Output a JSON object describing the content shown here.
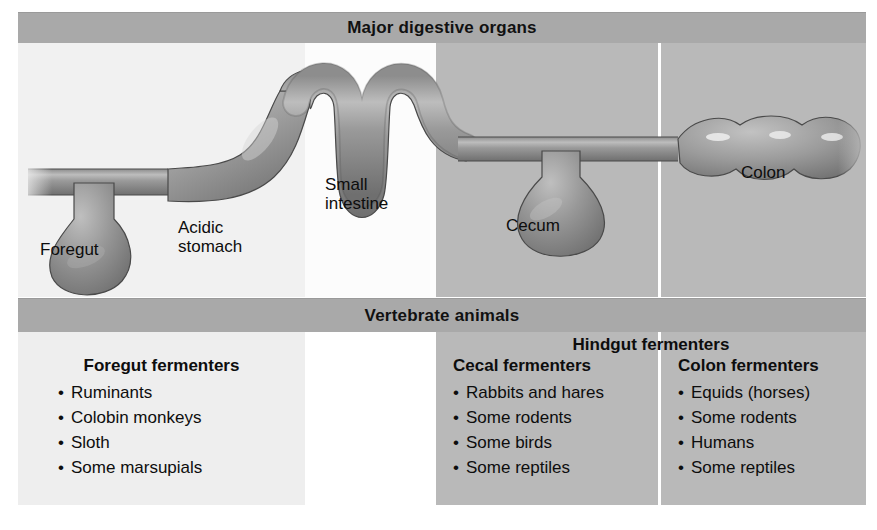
{
  "figure": {
    "top_banner": "Major digestive organs",
    "middle_banner": "Vertebrate animals"
  },
  "diagram": {
    "labels": {
      "foregut": "Foregut",
      "acidic_stomach": "Acidic\nstomach",
      "small_intestine": "Small\nintestine",
      "cecum": "Cecum",
      "colon": "Colon"
    }
  },
  "table": {
    "hindgut_header": "Hindgut fermenters",
    "columns": [
      {
        "header": "Foregut fermenters",
        "items": [
          "Ruminants",
          "Colobin monkeys",
          "Sloth",
          "Some marsupials"
        ]
      },
      {
        "header": "Cecal fermenters",
        "items": [
          "Rabbits and hares",
          "Some rodents",
          "Some birds",
          "Some reptiles"
        ]
      },
      {
        "header": "Colon fermenters",
        "items": [
          "Equids (horses)",
          "Some rodents",
          "Humans",
          "Some reptiles"
        ]
      }
    ]
  },
  "colors": {
    "banner_gray": "#a9a9a9",
    "light_panel": "#f1f1f1",
    "white_panel": "#fcfcfc",
    "dark_panel": "#b9b9b9",
    "organ_fill": "#8f8f8f",
    "divider": "#ffffff"
  }
}
